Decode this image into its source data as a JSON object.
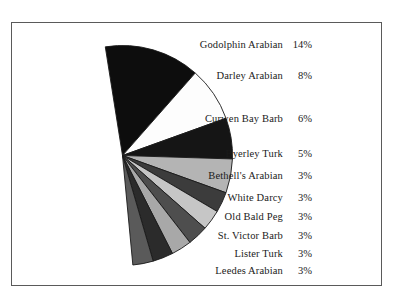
{
  "figure": {
    "background_color": "#ffffff",
    "frame_color": "#5a5a5a",
    "text_color": "#1a1a1a"
  },
  "chart_data": {
    "type": "pie",
    "title": "",
    "subtitle": "",
    "xlabel": "",
    "ylabel": "",
    "grid": false,
    "legend_position": "right-inline-labels",
    "partial_pie": true,
    "start_angle_deg": -99,
    "total_shown_percent": 51,
    "categories": [
      "Godolphin Arabian",
      "Darley Arabian",
      "Curwen Bay Barb",
      "Byerley Turk",
      "Bethell's Arabian",
      "White Darcy",
      "Old Bald Peg",
      "St. Victor Barb",
      "Lister Turk",
      "Leedes Arabian"
    ],
    "values": [
      14,
      8,
      6,
      5,
      3,
      3,
      3,
      3,
      3,
      3
    ],
    "value_labels": [
      "14%",
      "8%",
      "6%",
      "5%",
      "3%",
      "3%",
      "3%",
      "3%",
      "3%",
      "3%"
    ],
    "slice_colors": [
      "#0d0d0d",
      "#fdfdfd",
      "#151515",
      "#b4b4b4",
      "#3c3c3c",
      "#c6c6c6",
      "#4e4e4e",
      "#a8a8a8",
      "#2b2b2b",
      "#5a5a5a"
    ],
    "slice_edge_color": "#1a1a1a"
  },
  "labels": [
    {
      "name": "Godolphin Arabian",
      "pct": "14%"
    },
    {
      "name": "Darley Arabian",
      "pct": "8%"
    },
    {
      "name": "Curwen Bay Barb",
      "pct": "6%"
    },
    {
      "name": "Byerley Turk",
      "pct": "5%"
    },
    {
      "name": "Bethell's Arabian",
      "pct": "3%"
    },
    {
      "name": "White Darcy",
      "pct": "3%"
    },
    {
      "name": "Old Bald Peg",
      "pct": "3%"
    },
    {
      "name": "St. Victor Barb",
      "pct": "3%"
    },
    {
      "name": "Lister Turk",
      "pct": "3%"
    },
    {
      "name": "Leedes Arabian",
      "pct": "3%"
    }
  ]
}
